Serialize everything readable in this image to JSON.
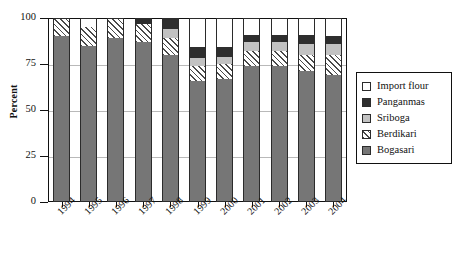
{
  "chart_data": {
    "type": "bar",
    "stacked": true,
    "title": "",
    "xlabel": "",
    "ylabel": "Percent",
    "ylim": [
      0,
      100
    ],
    "yticks": [
      0,
      25,
      50,
      75,
      100
    ],
    "ytick_labels": [
      "0",
      "25",
      "50",
      "75",
      "100"
    ],
    "grid": true,
    "grid_axis": "y",
    "legend_position": "right",
    "categories": [
      "1994",
      "1995",
      "1996",
      "1997",
      "1998",
      "1999",
      "2000",
      "2001",
      "2002",
      "2003",
      "2004"
    ],
    "series": [
      {
        "name": "Bogasari",
        "color": "#767676",
        "pattern": "solid",
        "values": [
          90,
          85,
          89,
          87,
          80,
          66,
          67,
          74,
          74,
          71,
          69
        ]
      },
      {
        "name": "Berdikari",
        "color": "#ffffff",
        "pattern": "hatched",
        "values": [
          10,
          10,
          11,
          10,
          9,
          8,
          8,
          8,
          8,
          9,
          11
        ]
      },
      {
        "name": "Sriboga",
        "color": "#c2c2c2",
        "pattern": "solid",
        "values": [
          0,
          0,
          0,
          0,
          5,
          4,
          4,
          5,
          5,
          6,
          6
        ]
      },
      {
        "name": "Panganmas",
        "color": "#2e2e2e",
        "pattern": "solid",
        "values": [
          0,
          0,
          0,
          3,
          6,
          6,
          5,
          4,
          4,
          5,
          4
        ]
      },
      {
        "name": "Import flour",
        "color": "#ffffff",
        "pattern": "solid",
        "values": [
          0,
          5,
          0,
          0,
          0,
          16,
          16,
          9,
          9,
          9,
          10
        ]
      }
    ],
    "legend_order": [
      "Import flour",
      "Panganmas",
      "Sriboga",
      "Berdikari",
      "Bogasari"
    ]
  },
  "legend": {
    "items": [
      {
        "label": "Import flour",
        "swatch": "import"
      },
      {
        "label": "Panganmas",
        "swatch": "panganmas"
      },
      {
        "label": "Sriboga",
        "swatch": "sriboga"
      },
      {
        "label": "Berdikari",
        "swatch": "berdikari"
      },
      {
        "label": "Bogasari",
        "swatch": "bogasari"
      }
    ]
  }
}
